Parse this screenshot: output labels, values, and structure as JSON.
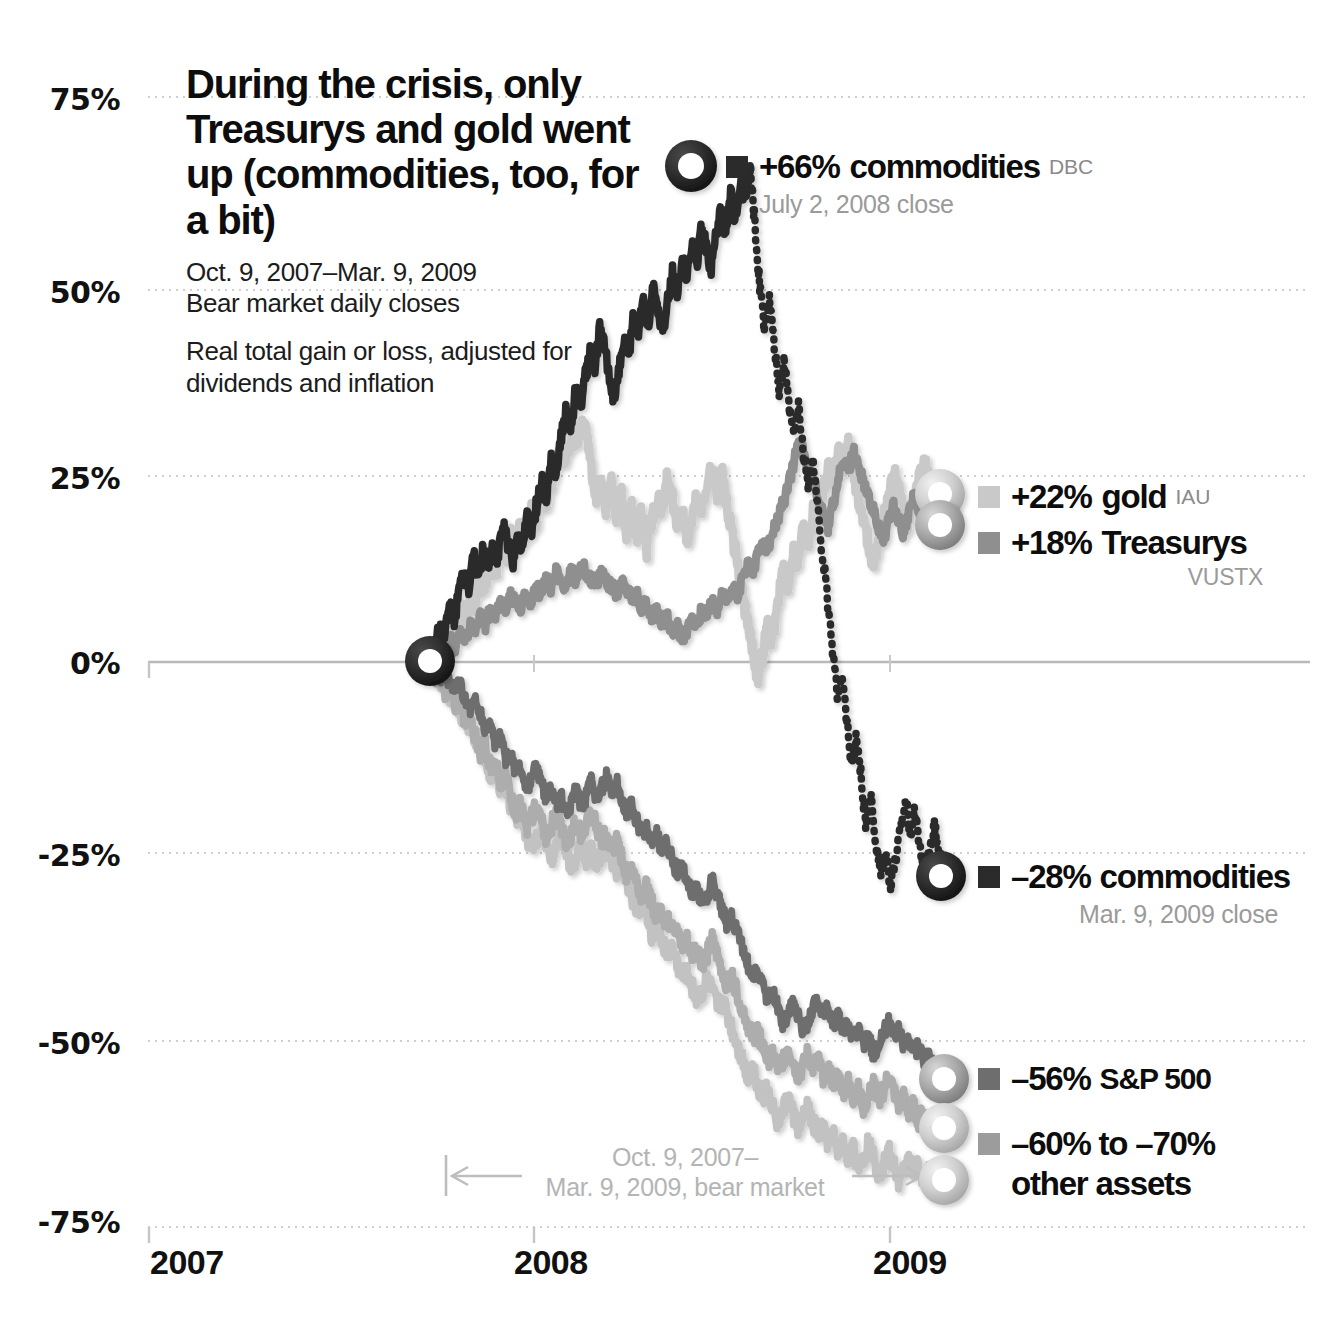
{
  "title": {
    "headline": "During the crisis, only Treasurys and gold went up (commodities, too, for a bit)",
    "date_range": "Oct. 9, 2007–Mar. 9, 2009",
    "subtitle_1": "Bear market daily closes",
    "subtitle_2": "Real total gain or loss, adjusted for dividends and inflation"
  },
  "callouts": {
    "commodities_peak": {
      "value": "+66%",
      "name": "commodities",
      "ticker": "DBC",
      "note": "July 2, 2008 close",
      "color": "#2b2b2b"
    },
    "gold": {
      "value": "+22%",
      "name": "gold",
      "ticker": "IAU",
      "color": "#c4c4c4"
    },
    "treasurys": {
      "value": "+18%",
      "name": "Treasurys",
      "ticker": "VUSTX",
      "color": "#8f8f8f"
    },
    "commodities_end": {
      "value": "–28%",
      "name": "commodities",
      "note": "Mar. 9, 2009 close",
      "color": "#2b2b2b"
    },
    "sp500": {
      "value": "–56%",
      "name": "S&P 500",
      "color": "#6e6e6e"
    },
    "other_assets": {
      "value": "–60% to –70%",
      "name": "other assets",
      "color": "#9c9c9c"
    }
  },
  "bear_market_note": {
    "line1": "Oct. 9, 2007–",
    "line2": "Mar. 9, 2009, bear market"
  },
  "chart_data": {
    "type": "line",
    "title": "During the crisis, only Treasurys and gold went up (commodities, too, for a bit)",
    "subtitle": "Oct. 9, 2007–Mar. 9, 2009 Bear market daily closes. Real total gain or loss, adjusted for dividends and inflation",
    "xlabel": "",
    "ylabel": "Real total gain or loss",
    "ylim": [
      -75,
      75
    ],
    "yticks": [
      "75%",
      "50%",
      "25%",
      "0%",
      "-25%",
      "-50%",
      "-75%"
    ],
    "ytick_values": [
      75,
      50,
      25,
      0,
      -25,
      -50,
      -75
    ],
    "xticks": [
      "2007",
      "2008",
      "2009"
    ],
    "xtick_values": [
      2007,
      2008,
      2009
    ],
    "grid": true,
    "legend_position": "right-inline-callouts",
    "x_start": "Oct. 9, 2007",
    "x_end": "Mar. 9, 2009",
    "annotations": [
      {
        "label": "+66% commodities DBC — July 2, 2008 close",
        "x": 0.52,
        "y": 66
      },
      {
        "label": "+22% gold IAU",
        "x": 1.0,
        "y": 22
      },
      {
        "label": "+18% Treasurys VUSTX",
        "x": 1.0,
        "y": 18
      },
      {
        "label": "–28% commodities — Mar. 9, 2009 close",
        "x": 1.0,
        "y": -28
      },
      {
        "label": "–56% S&P 500",
        "x": 1.0,
        "y": -56
      },
      {
        "label": "–60% to –70% other assets",
        "x": 1.0,
        "y": -66
      },
      {
        "label": "Oct. 9, 2007–Mar. 9, 2009, bear market",
        "x": 0.5,
        "y": -70
      }
    ],
    "series": [
      {
        "name": "commodities",
        "ticker": "DBC",
        "color": "#2b2b2b",
        "style": "solid-then-dotted",
        "start_value": 0,
        "peak_value": 66,
        "peak_date": "July 2, 2008",
        "end_value": -28,
        "values": [
          0,
          2,
          5,
          3,
          7,
          6,
          9,
          12,
          10,
          14,
          11,
          15,
          13,
          16,
          14,
          18,
          16,
          13,
          17,
          15,
          19,
          17,
          21,
          24,
          22,
          27,
          25,
          30,
          33,
          31,
          36,
          34,
          38,
          41,
          39,
          44,
          42,
          38,
          35,
          39,
          43,
          41,
          46,
          44,
          48,
          45,
          50,
          47,
          44,
          48,
          52,
          49,
          54,
          51,
          56,
          53,
          58,
          55,
          52,
          57,
          60,
          57,
          62,
          59,
          64,
          61,
          66,
          58,
          50,
          44,
          48,
          42,
          36,
          40,
          34,
          30,
          34,
          28,
          24,
          27,
          20,
          14,
          8,
          2,
          -4,
          -2,
          -8,
          -14,
          -10,
          -16,
          -22,
          -18,
          -24,
          -28,
          -26,
          -30,
          -26,
          -22,
          -18,
          -23,
          -20,
          -24,
          -28,
          -26,
          -22,
          -25,
          -28
        ]
      },
      {
        "name": "gold",
        "ticker": "IAU",
        "color": "#c9c9c9",
        "style": "solid",
        "start_value": 0,
        "end_value": 22,
        "values": [
          0,
          1,
          3,
          2,
          5,
          4,
          7,
          6,
          9,
          8,
          11,
          10,
          13,
          12,
          15,
          14,
          17,
          16,
          18,
          17,
          20,
          19,
          22,
          21,
          24,
          26,
          28,
          27,
          30,
          29,
          32,
          30,
          26,
          22,
          25,
          20,
          24,
          18,
          22,
          17,
          21,
          16,
          20,
          15,
          19,
          22,
          20,
          24,
          22,
          18,
          20,
          16,
          19,
          22,
          20,
          24,
          26,
          22,
          25,
          20,
          17,
          13,
          9,
          5,
          2,
          -2,
          1,
          5,
          3,
          8,
          12,
          10,
          15,
          13,
          18,
          16,
          20,
          18,
          23,
          26,
          24,
          28,
          26,
          29,
          25,
          22,
          19,
          16,
          13,
          16,
          19,
          22,
          25,
          23,
          20,
          18,
          21,
          24,
          27,
          24,
          21,
          19,
          22
        ]
      },
      {
        "name": "Treasurys",
        "ticker": "VUSTX",
        "color": "#8f8f8f",
        "style": "solid",
        "start_value": 0,
        "end_value": 18,
        "values": [
          0,
          1,
          2,
          1,
          3,
          2,
          4,
          3,
          5,
          4,
          6,
          5,
          7,
          6,
          8,
          7,
          9,
          8,
          7,
          9,
          8,
          10,
          9,
          11,
          10,
          12,
          11,
          10,
          12,
          11,
          13,
          12,
          11,
          10,
          12,
          11,
          10,
          9,
          11,
          10,
          8,
          9,
          7,
          8,
          6,
          7,
          5,
          6,
          4,
          5,
          3,
          4,
          6,
          5,
          7,
          6,
          8,
          7,
          9,
          8,
          10,
          9,
          11,
          13,
          12,
          14,
          16,
          15,
          17,
          19,
          21,
          23,
          26,
          29,
          28,
          26,
          24,
          22,
          20,
          18,
          21,
          24,
          27,
          25,
          28,
          26,
          24,
          22,
          20,
          18,
          16,
          19,
          21,
          19,
          17,
          20,
          22,
          20,
          18,
          21,
          19,
          17,
          18
        ]
      },
      {
        "name": "S&P 500",
        "color": "#6e6e6e",
        "style": "solid",
        "start_value": 0,
        "end_value": -56,
        "values": [
          0,
          -1,
          -2,
          -1,
          -3,
          -4,
          -3,
          -5,
          -6,
          -5,
          -7,
          -9,
          -8,
          -11,
          -10,
          -13,
          -12,
          -15,
          -14,
          -17,
          -16,
          -14,
          -16,
          -18,
          -17,
          -19,
          -18,
          -20,
          -19,
          -17,
          -19,
          -18,
          -16,
          -18,
          -17,
          -15,
          -17,
          -16,
          -18,
          -20,
          -19,
          -21,
          -23,
          -22,
          -24,
          -23,
          -25,
          -24,
          -26,
          -28,
          -27,
          -29,
          -31,
          -30,
          -32,
          -31,
          -29,
          -31,
          -33,
          -35,
          -34,
          -36,
          -38,
          -40,
          -42,
          -41,
          -43,
          -45,
          -44,
          -46,
          -48,
          -47,
          -45,
          -47,
          -49,
          -48,
          -46,
          -45,
          -47,
          -46,
          -48,
          -47,
          -49,
          -48,
          -50,
          -49,
          -51,
          -50,
          -52,
          -51,
          -49,
          -48,
          -50,
          -49,
          -51,
          -50,
          -52,
          -51,
          -53,
          -52,
          -54,
          -55,
          -56
        ]
      },
      {
        "name": "other assets A",
        "color": "#adadad",
        "style": "solid",
        "start_value": 0,
        "end_value": -62,
        "values": [
          0,
          -2,
          -1,
          -4,
          -3,
          -6,
          -5,
          -8,
          -7,
          -10,
          -12,
          -11,
          -14,
          -13,
          -16,
          -15,
          -18,
          -20,
          -19,
          -22,
          -21,
          -19,
          -21,
          -23,
          -22,
          -20,
          -22,
          -24,
          -23,
          -21,
          -23,
          -22,
          -20,
          -22,
          -24,
          -23,
          -25,
          -24,
          -26,
          -28,
          -27,
          -29,
          -31,
          -30,
          -32,
          -34,
          -33,
          -35,
          -34,
          -36,
          -38,
          -37,
          -39,
          -38,
          -40,
          -39,
          -37,
          -39,
          -41,
          -43,
          -42,
          -44,
          -46,
          -48,
          -50,
          -49,
          -51,
          -53,
          -52,
          -54,
          -53,
          -51,
          -53,
          -55,
          -54,
          -52,
          -54,
          -53,
          -55,
          -54,
          -56,
          -55,
          -57,
          -56,
          -58,
          -57,
          -59,
          -58,
          -56,
          -58,
          -57,
          -55,
          -57,
          -59,
          -58,
          -60,
          -59,
          -61,
          -60,
          -62,
          -61,
          -63,
          -62
        ]
      },
      {
        "name": "other assets B",
        "color": "#c2c2c2",
        "style": "solid",
        "start_value": 0,
        "end_value": -70,
        "values": [
          0,
          -1,
          -3,
          -2,
          -5,
          -4,
          -7,
          -9,
          -8,
          -11,
          -10,
          -13,
          -15,
          -14,
          -17,
          -16,
          -19,
          -21,
          -20,
          -23,
          -25,
          -24,
          -22,
          -24,
          -26,
          -25,
          -23,
          -25,
          -27,
          -26,
          -24,
          -26,
          -25,
          -27,
          -26,
          -24,
          -26,
          -28,
          -27,
          -29,
          -31,
          -33,
          -32,
          -34,
          -36,
          -35,
          -37,
          -39,
          -38,
          -40,
          -42,
          -41,
          -43,
          -45,
          -44,
          -42,
          -44,
          -46,
          -45,
          -47,
          -49,
          -51,
          -53,
          -55,
          -54,
          -56,
          -58,
          -57,
          -59,
          -61,
          -60,
          -58,
          -60,
          -62,
          -61,
          -59,
          -61,
          -63,
          -62,
          -64,
          -63,
          -65,
          -64,
          -66,
          -65,
          -67,
          -66,
          -64,
          -66,
          -68,
          -67,
          -65,
          -67,
          -69,
          -68,
          -66,
          -68,
          -67,
          -69,
          -68,
          -70,
          -69,
          -70
        ]
      }
    ]
  }
}
